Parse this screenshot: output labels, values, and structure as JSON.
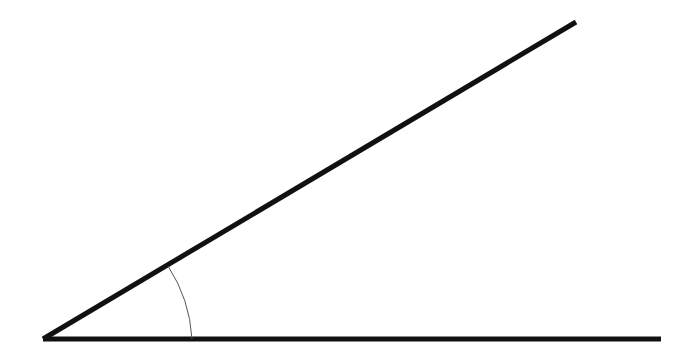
{
  "diagram": {
    "type": "angle",
    "background": "#ffffff",
    "line_color": "#111111",
    "vertex": {
      "x": 43,
      "y": 339
    },
    "rays": [
      {
        "name": "upper-ray",
        "end": {
          "x": 576,
          "y": 22
        },
        "stroke_width": 5
      },
      {
        "name": "base-ray",
        "end": {
          "x": 661,
          "y": 339
        },
        "stroke_width": 5
      }
    ],
    "arc": {
      "start": {
        "x": 168,
        "y": 266
      },
      "end": {
        "x": 192,
        "y": 339
      },
      "radius": 149,
      "stroke_width": 1,
      "color": "#555555"
    }
  }
}
